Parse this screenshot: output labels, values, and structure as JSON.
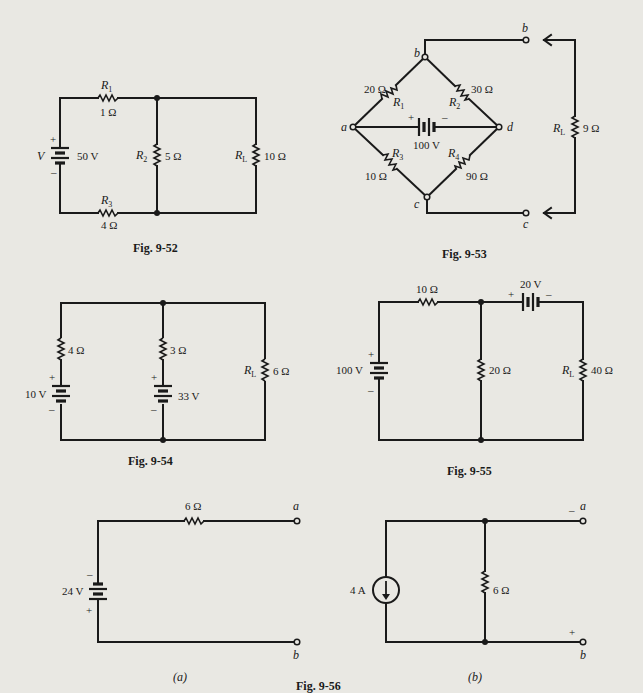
{
  "figures": {
    "fig_52": {
      "caption": "Fig. 9-52",
      "source": {
        "label": "V",
        "value": "50 V",
        "plus": "+",
        "minus": "–"
      },
      "r1": {
        "name": "R",
        "sub": "1",
        "value": "1 Ω"
      },
      "r2": {
        "name": "R",
        "sub": "2",
        "value": "5 Ω"
      },
      "r3": {
        "name": "R",
        "sub": "3",
        "value": "4 Ω"
      },
      "rl": {
        "name": "R",
        "sub": "L",
        "value": "10 Ω"
      }
    },
    "fig_53": {
      "caption": "Fig. 9-53",
      "nodes": {
        "a": "a",
        "b": "b",
        "c": "c",
        "d": "d"
      },
      "terminals": {
        "b": "b",
        "c": "c"
      },
      "source": {
        "value": "100 V",
        "plus": "+",
        "minus": "–"
      },
      "r1": {
        "name": "R",
        "sub": "1",
        "value": "20 Ω"
      },
      "r2": {
        "name": "R",
        "sub": "2",
        "value": "30 Ω"
      },
      "r3": {
        "name": "R",
        "sub": "3",
        "value": "10 Ω"
      },
      "r4": {
        "name": "R",
        "sub": "4",
        "value": "90 Ω"
      },
      "rl": {
        "name": "R",
        "sub": "L",
        "value": "9 Ω"
      }
    },
    "fig_54": {
      "caption": "Fig. 9-54",
      "source1": {
        "value": "10 V",
        "plus": "+",
        "minus": "–"
      },
      "source2": {
        "value": "33 V",
        "plus": "+",
        "minus": "–"
      },
      "r_left": {
        "value": "4 Ω"
      },
      "r_mid": {
        "value": "3 Ω"
      },
      "rl": {
        "name": "R",
        "sub": "L",
        "value": "6 Ω"
      }
    },
    "fig_55": {
      "caption": "Fig. 9-55",
      "source1": {
        "value": "100 V",
        "plus": "+",
        "minus": "–"
      },
      "source2": {
        "value": "20 V",
        "plus": "+",
        "minus": "–"
      },
      "r_series": {
        "value": "10 Ω"
      },
      "r_shunt": {
        "value": "20 Ω"
      },
      "rl": {
        "name": "R",
        "sub": "L",
        "value": "40 Ω"
      }
    },
    "fig_56": {
      "caption": "Fig. 9-56",
      "part_a": {
        "label": "(a)",
        "source": {
          "value": "24 V",
          "minus": "–",
          "plus": "+"
        },
        "resistor": {
          "value": "6 Ω"
        },
        "terminal_a": "a",
        "terminal_b": "b"
      },
      "part_b": {
        "label": "(b)",
        "current_source": {
          "value": "4 A"
        },
        "resistor": {
          "value": "6 Ω"
        },
        "terminal_a": "a",
        "terminal_b": "b",
        "sign_a": "–",
        "sign_b": "+"
      }
    }
  }
}
